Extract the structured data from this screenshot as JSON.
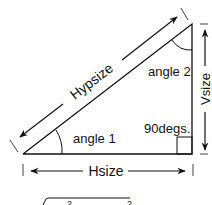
{
  "diagram": {
    "type": "right-triangle",
    "labels": {
      "hypotenuse": "Hypsize",
      "vertical": "Vsize",
      "horizontal": "Hsize",
      "angle1": "angle 1",
      "angle2": "angle 2",
      "right_angle": "90degs."
    },
    "formula_partial": {
      "exponent_left": "2",
      "exponent_right": "2"
    },
    "colors": {
      "stroke": "#111111",
      "background": "#ffffff"
    }
  }
}
